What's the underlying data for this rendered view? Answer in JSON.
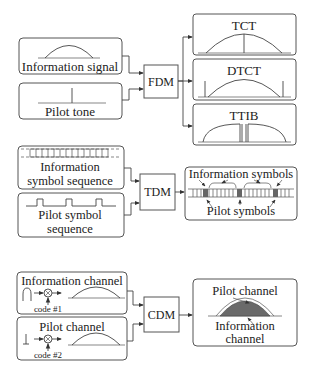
{
  "fdm": {
    "inputs": [
      {
        "label": "Information signal",
        "icon": "information-signal-arc"
      },
      {
        "label": "Pilot tone",
        "icon": "pilot-tone-spike"
      }
    ],
    "block_label": "FDM",
    "outputs": [
      {
        "label": "TCT",
        "icon": "tct-spectrum"
      },
      {
        "label": "DTCT",
        "icon": "dtct-spectrum"
      },
      {
        "label": "TTIB",
        "icon": "ttib-spectrum"
      }
    ]
  },
  "tdm": {
    "inputs": [
      {
        "label_line1": "Information",
        "label_line2": "symbol sequence",
        "icon": "symbol-sequence"
      },
      {
        "label_line1": "Pilot symbol",
        "label_line2": "sequence",
        "icon": "pilot-pulse-train"
      }
    ],
    "block_label": "TDM",
    "output": {
      "top_label": "Information symbols",
      "bottom_label": "Pilot symbols"
    }
  },
  "cdm": {
    "inputs": [
      {
        "label": "Information channel",
        "code_label": "code #1"
      },
      {
        "label": "Pilot channel",
        "code_label": "code #2"
      }
    ],
    "block_label": "CDM",
    "output": {
      "top_label": "Pilot channel",
      "bottom_label_line1": "Information",
      "bottom_label_line2": "channel"
    }
  },
  "colors": {
    "stroke": "#444444",
    "filled_region": "#6a6a6a",
    "background": "#ffffff"
  }
}
